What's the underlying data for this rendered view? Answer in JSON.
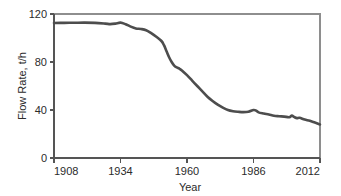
{
  "chart_data": {
    "type": "line",
    "title": "",
    "xlabel": "Year",
    "ylabel": "Flow Rate, t/h",
    "xlim": [
      1908,
      2012
    ],
    "ylim": [
      0,
      120
    ],
    "grid": false,
    "legend": null,
    "xticks": [
      "1908",
      "1934",
      "1960",
      "1986",
      "2012"
    ],
    "xtick_values": [
      1908,
      1934,
      1960,
      1986,
      2012
    ],
    "yticks": [
      "0",
      "40",
      "80",
      "120"
    ],
    "ytick_values": [
      0,
      40,
      80,
      120
    ],
    "line_color": "#4d4d4d",
    "line_width": 2.6,
    "series": [
      {
        "name": "Flow Rate",
        "x": [
          1908,
          1912,
          1916,
          1920,
          1924,
          1928,
          1930,
          1932,
          1934,
          1936,
          1938,
          1940,
          1942,
          1944,
          1946,
          1948,
          1950,
          1951,
          1952,
          1953,
          1954,
          1955,
          1956,
          1957,
          1958,
          1960,
          1962,
          1964,
          1966,
          1968,
          1970,
          1972,
          1974,
          1976,
          1978,
          1980,
          1982,
          1984,
          1986,
          1987,
          1988,
          1990,
          1992,
          1994,
          1996,
          1998,
          2000,
          2001,
          2002,
          2003,
          2004,
          2006,
          2008,
          2010,
          2012
        ],
        "y": [
          112.5,
          112.6,
          112.7,
          112.8,
          112.6,
          112.0,
          111.6,
          112.0,
          112.8,
          111.5,
          109.5,
          108.0,
          107.5,
          106.5,
          104.0,
          101.0,
          97.5,
          94.0,
          89.0,
          84.0,
          80.0,
          77.0,
          75.5,
          74.5,
          73.0,
          69.0,
          64.5,
          60.0,
          55.5,
          51.0,
          47.5,
          44.5,
          42.0,
          40.0,
          39.0,
          38.5,
          38.2,
          38.5,
          40.0,
          39.5,
          38.0,
          37.0,
          36.2,
          35.2,
          34.8,
          34.5,
          34.0,
          35.3,
          34.0,
          33.2,
          33.5,
          32.0,
          31.0,
          29.5,
          28.0
        ]
      }
    ]
  }
}
